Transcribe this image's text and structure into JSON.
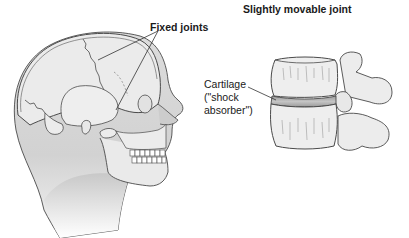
{
  "diagram": {
    "skull_section": {
      "title": "Fixed joints",
      "subject": "head-with-skull"
    },
    "spine_section": {
      "title": "Slightly movable joint",
      "subject": "vertebrae",
      "callout": {
        "lines": [
          "Cartilage",
          "(\"shock",
          "absorber\")"
        ]
      }
    },
    "colors": {
      "background": "#ffffff",
      "outline": "#4a4a4a",
      "bone_fill": "#eaeaea",
      "skin_fill": "#d8d8d8",
      "cartilage_band": "#a8a8a8",
      "text": "#1a1a1a"
    }
  }
}
